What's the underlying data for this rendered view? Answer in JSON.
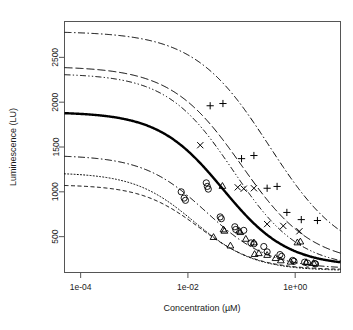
{
  "chart_data": {
    "type": "line",
    "title": "",
    "xlabel": "Concentration (µM)",
    "ylabel": "Luminescence (LU)",
    "xscale": "log10",
    "yscale": "linear",
    "xlim": [
      5e-05,
      7.0
    ],
    "ylim": [
      100,
      2900
    ],
    "grid": false,
    "legend": "none",
    "xticks": [
      {
        "value": 0.0001,
        "label": "1e-04"
      },
      {
        "value": 0.01,
        "label": "1e-02"
      },
      {
        "value": 1.0,
        "label": "1e+00"
      }
    ],
    "yticks": [
      {
        "value": 500,
        "label": "500"
      },
      {
        "value": 1000,
        "label": "1000"
      },
      {
        "value": 1500,
        "label": "1500"
      },
      {
        "value": 2000,
        "label": "2000"
      },
      {
        "value": 2500,
        "label": "2500"
      }
    ],
    "curve_model": "four-parameter log-logistic: y = bottom + (top-bottom)/(1+(x/ec50)^hill)",
    "series": [
      {
        "name": "curve-1-dashdot-top",
        "style": "dash-dot",
        "width": 1.0,
        "color": "#000000",
        "top": 2790,
        "bottom": 230,
        "ec50": 0.33,
        "hill": 0.62
      },
      {
        "name": "curve-2-longdash",
        "style": "long-dash",
        "width": 1.0,
        "color": "#000000",
        "top": 2400,
        "bottom": 190,
        "ec50": 0.1,
        "hill": 0.66
      },
      {
        "name": "curve-3-dashdotdot",
        "style": "dash-dot-dot",
        "width": 1.0,
        "color": "#000000",
        "top": 2320,
        "bottom": 150,
        "ec50": 0.07,
        "hill": 0.7
      },
      {
        "name": "curve-4-solid-bold",
        "style": "solid",
        "width": 2.4,
        "color": "#000000",
        "top": 1890,
        "bottom": 170,
        "ec50": 0.045,
        "hill": 0.72
      },
      {
        "name": "curve-5-dashdot",
        "style": "dash-dot",
        "width": 1.0,
        "color": "#000000",
        "top": 1410,
        "bottom": 140,
        "ec50": 0.022,
        "hill": 0.74
      },
      {
        "name": "curve-6-dotted",
        "style": "dotted",
        "width": 1.0,
        "color": "#000000",
        "top": 1215,
        "bottom": 120,
        "ec50": 0.013,
        "hill": 0.78
      },
      {
        "name": "curve-7-dashed",
        "style": "short-dash",
        "width": 1.0,
        "color": "#000000",
        "top": 1080,
        "bottom": 130,
        "ec50": 0.016,
        "hill": 0.8
      }
    ],
    "point_groups": [
      {
        "name": "plus-markers",
        "marker": "plus",
        "color": "#000000",
        "points": [
          [
            0.026,
            1960
          ],
          [
            0.045,
            1985
          ],
          [
            0.1,
            1370
          ],
          [
            0.17,
            1405
          ],
          [
            0.46,
            1060
          ],
          [
            0.7,
            770
          ],
          [
            1.3,
            690
          ],
          [
            2.6,
            680
          ],
          [
            0.3,
            1040
          ]
        ]
      },
      {
        "name": "cross-markers",
        "marker": "cross",
        "color": "#000000",
        "points": [
          [
            0.017,
            1520
          ],
          [
            0.11,
            1035
          ],
          [
            0.17,
            1040
          ],
          [
            0.3,
            640
          ],
          [
            0.6,
            620
          ],
          [
            1.2,
            560
          ],
          [
            0.085,
            1050
          ]
        ]
      },
      {
        "name": "circle-markers",
        "marker": "circle",
        "color": "#000000",
        "points": [
          [
            0.0075,
            1000
          ],
          [
            0.0085,
            930
          ],
          [
            0.009,
            905
          ],
          [
            0.022,
            1100
          ],
          [
            0.023,
            1060
          ],
          [
            0.024,
            1030
          ],
          [
            0.04,
            720
          ],
          [
            0.042,
            700
          ],
          [
            0.075,
            610
          ],
          [
            0.078,
            580
          ],
          [
            0.11,
            570
          ],
          [
            0.15,
            430
          ],
          [
            0.17,
            420
          ],
          [
            0.26,
            390
          ],
          [
            0.3,
            330
          ],
          [
            0.52,
            300
          ],
          [
            0.56,
            280
          ],
          [
            0.9,
            235
          ],
          [
            0.95,
            225
          ],
          [
            1.5,
            215
          ],
          [
            1.7,
            205
          ],
          [
            2.3,
            200
          ],
          [
            2.4,
            195
          ]
        ]
      },
      {
        "name": "triangle-markers",
        "marker": "triangle",
        "color": "#000000",
        "points": [
          [
            0.03,
            490
          ],
          [
            0.046,
            575
          ],
          [
            0.048,
            560
          ],
          [
            0.062,
            395
          ],
          [
            0.09,
            560
          ],
          [
            0.095,
            545
          ],
          [
            0.12,
            470
          ],
          [
            0.17,
            430
          ],
          [
            0.175,
            300
          ],
          [
            0.21,
            310
          ],
          [
            0.3,
            290
          ],
          [
            0.43,
            255
          ],
          [
            0.54,
            230
          ],
          [
            0.82,
            215
          ],
          [
            1.1,
            430
          ],
          [
            1.25,
            440
          ],
          [
            1.6,
            210
          ],
          [
            2.2,
            200
          ],
          [
            0.044,
            1060
          ]
        ]
      }
    ]
  },
  "axes": {
    "box_color": "#555555",
    "tick_color": "#555555"
  }
}
